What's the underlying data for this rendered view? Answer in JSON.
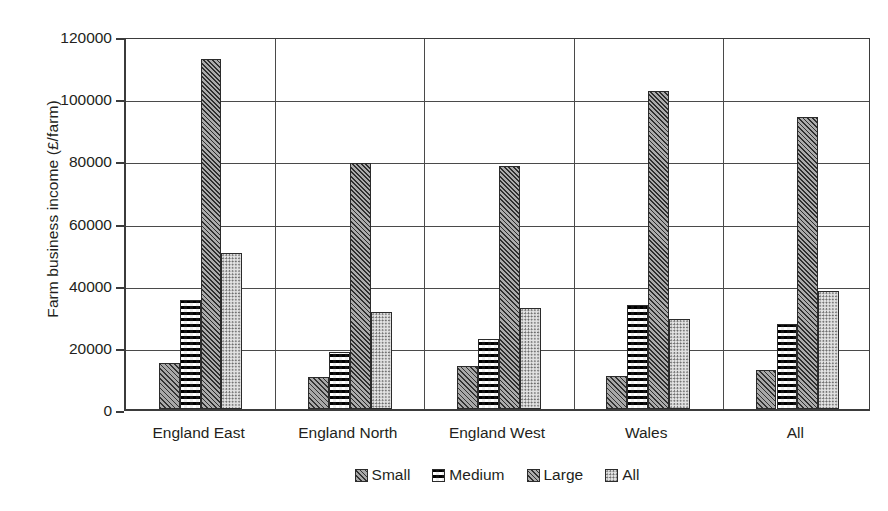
{
  "chart_data": {
    "type": "bar",
    "title": "",
    "xlabel": "",
    "ylabel": "Farm business income (£/farm)",
    "ylim": [
      0,
      120000
    ],
    "ytick_step": 20000,
    "yticks": [
      "0",
      "20000",
      "40000",
      "60000",
      "80000",
      "100000",
      "120000"
    ],
    "grid": true,
    "legend_position": "bottom",
    "categories": [
      "England East",
      "England North",
      "England West",
      "Wales",
      "All"
    ],
    "series": [
      {
        "name": "Small",
        "values": [
          14800,
          10300,
          13800,
          10500,
          12600
        ]
      },
      {
        "name": "Medium",
        "values": [
          35000,
          18400,
          22400,
          33600,
          27400
        ]
      },
      {
        "name": "Large",
        "values": [
          112500,
          79000,
          78200,
          102200,
          93800
        ]
      },
      {
        "name": "All",
        "values": [
          50300,
          31200,
          32400,
          28900,
          38000
        ]
      }
    ],
    "pattern_names": [
      "diagonal-hatch",
      "checkerboard",
      "dense-diagonal-hatch",
      "dotted"
    ]
  },
  "legend": {
    "items": [
      {
        "label": "Small",
        "swatch": "diagonal-hatch-swatch"
      },
      {
        "label": "Medium",
        "swatch": "checkerboard-swatch"
      },
      {
        "label": "Large",
        "swatch": "dense-diagonal-hatch-swatch"
      },
      {
        "label": "All",
        "swatch": "dotted-swatch"
      }
    ]
  },
  "axis": {
    "y_title": "Farm business income (£/farm)"
  }
}
